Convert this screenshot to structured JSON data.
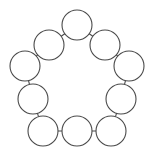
{
  "diagram": {
    "type": "node-link-cycle-graph",
    "background_color": "#ffffff",
    "stroke_color": "#4a4a4a",
    "node_fill_color": "#ffffff",
    "stroke_width": 1.1,
    "node_radius": 15,
    "node_count": 10,
    "edge_count": 10,
    "canvas": {
      "width": 153,
      "height": 152
    },
    "nodes": [
      {
        "id": "n1",
        "label": "",
        "cx": 77,
        "cy": 25,
        "r": 15,
        "position": "top-center"
      },
      {
        "id": "n2",
        "label": "",
        "cx": 105,
        "cy": 45,
        "r": 15,
        "position": "upper-right"
      },
      {
        "id": "n3",
        "label": "",
        "cx": 129,
        "cy": 66,
        "r": 15,
        "position": "right-upper"
      },
      {
        "id": "n4",
        "label": "",
        "cx": 121,
        "cy": 99,
        "r": 15,
        "position": "right-lower"
      },
      {
        "id": "n5",
        "label": "",
        "cx": 111,
        "cy": 131,
        "r": 15,
        "position": "bottom-right"
      },
      {
        "id": "n6",
        "label": "",
        "cx": 77,
        "cy": 131,
        "r": 15,
        "position": "bottom-center"
      },
      {
        "id": "n7",
        "label": "",
        "cx": 43,
        "cy": 131,
        "r": 15,
        "position": "bottom-left"
      },
      {
        "id": "n8",
        "label": "",
        "cx": 33,
        "cy": 99,
        "r": 15,
        "position": "left-lower"
      },
      {
        "id": "n9",
        "label": "",
        "cx": 25,
        "cy": 66,
        "r": 15,
        "position": "left-upper"
      },
      {
        "id": "n10",
        "label": "",
        "cx": 49,
        "cy": 45,
        "r": 15,
        "position": "upper-left"
      }
    ],
    "edges": [
      {
        "from": "n1",
        "to": "n2"
      },
      {
        "from": "n2",
        "to": "n3"
      },
      {
        "from": "n3",
        "to": "n4"
      },
      {
        "from": "n4",
        "to": "n5"
      },
      {
        "from": "n5",
        "to": "n6"
      },
      {
        "from": "n6",
        "to": "n7"
      },
      {
        "from": "n7",
        "to": "n8"
      },
      {
        "from": "n8",
        "to": "n9"
      },
      {
        "from": "n9",
        "to": "n10"
      },
      {
        "from": "n10",
        "to": "n1"
      }
    ]
  }
}
